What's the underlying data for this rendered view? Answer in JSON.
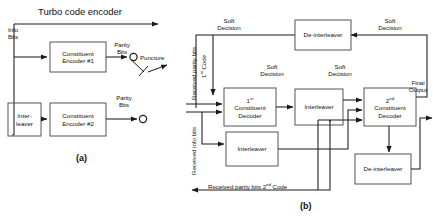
{
  "figure": {
    "title_encoder": "Turbo code encoder",
    "part_a": "(a)",
    "part_b": "(b)"
  },
  "encoder": {
    "input_label": "Info\nBits",
    "blocks": [
      {
        "id": "constituent-encoder-1",
        "label": "Constituent\nEncoder #1"
      },
      {
        "id": "interleaver",
        "label": "Inter-\nleaver"
      },
      {
        "id": "constituent-encoder-2",
        "label": "Constituent\nEncoder #2"
      }
    ],
    "parity_label_1": "Parity\nBits",
    "parity_label_2": "Parity\nBits",
    "puncture_label": "Puncture"
  },
  "decoder": {
    "inputs": [
      {
        "id": "received-parity-bits-1st-code",
        "label": "Received parity bits",
        "sup_text": "1st Code",
        "sup_base": "1",
        "sup_mark": "st"
      },
      {
        "id": "received-info-bits",
        "label": "Received info bits"
      },
      {
        "id": "received-parity-bits-2nd-code",
        "label": "Received parity bits 2",
        "sup_mark": "nd",
        "label_tail": " Code"
      }
    ],
    "blocks": [
      {
        "id": "de-interleaver-top",
        "label": "De-interleaver"
      },
      {
        "id": "first-constituent-decoder",
        "label": "1st\nConstituent\nDecoder",
        "sup_base": "1",
        "sup_mark": "st",
        "rest": "Constituent\nDecoder"
      },
      {
        "id": "interleaver-upper",
        "label": "Interleaver"
      },
      {
        "id": "interleaver-lower",
        "label": "Interleaver"
      },
      {
        "id": "second-constituent-decoder",
        "label": "2nd\nConstituent\nDecoder",
        "sup_base": "2",
        "sup_mark": "nd",
        "rest": "Constituent\nDecoder"
      },
      {
        "id": "de-interleaver-bottom",
        "label": "De-interleaver"
      }
    ],
    "soft_decision_labels": [
      {
        "id": "soft-decision-top-left",
        "label": "Soft\nDecision"
      },
      {
        "id": "soft-decision-top-right",
        "label": "Soft\nDecision"
      },
      {
        "id": "soft-decision-mid-left",
        "label": "Soft\nDecision"
      },
      {
        "id": "soft-decision-mid-right",
        "label": "Soft\nDecision"
      }
    ],
    "final_output_label": "Final\nOutput"
  },
  "colors": {
    "line": "#1a1a1a",
    "box_stroke": "#555555",
    "background": "#ffffff"
  }
}
